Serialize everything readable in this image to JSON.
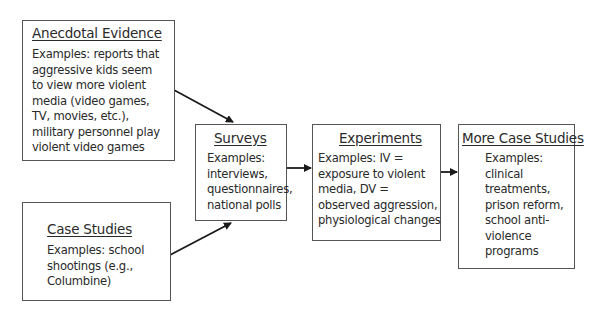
{
  "diagram": {
    "nodes": [
      {
        "id": "anecdotal",
        "title": "Anecdotal Evidence",
        "lines": [
          "Examples: reports that",
          "aggressive kids seem",
          "to view more violent",
          "media (video games,",
          "TV, movies, etc.),",
          "military personnel play",
          "violent video games"
        ]
      },
      {
        "id": "case_studies",
        "title": "Case Studies",
        "lines": [
          "Examples: school",
          "shootings (e.g.,",
          "Columbine)"
        ]
      },
      {
        "id": "surveys",
        "title": "Surveys",
        "lines": [
          "Examples:",
          "interviews,",
          "questionnaires,",
          "national polls"
        ]
      },
      {
        "id": "experiments",
        "title": "Experiments",
        "lines": [
          "Examples: IV =",
          "exposure to violent",
          "media, DV =",
          "observed aggression,",
          "physiological changes"
        ]
      },
      {
        "id": "more_case_studies",
        "title": "More Case Studies",
        "lines": [
          "Examples:",
          "clinical",
          "treatments,",
          "prison reform,",
          "school anti-",
          "violence",
          "programs"
        ]
      }
    ],
    "edges": [
      {
        "from": "Anecdotal Evidence",
        "to": "Surveys"
      },
      {
        "from": "Case Studies",
        "to": "Surveys"
      },
      {
        "from": "Surveys",
        "to": "Experiments"
      },
      {
        "from": "Experiments",
        "to": "More Case Studies"
      }
    ],
    "colors": {
      "border": "#555555",
      "text": "#2a2a2a",
      "arrow": "#1a1a1a",
      "background": "#ffffff"
    }
  }
}
